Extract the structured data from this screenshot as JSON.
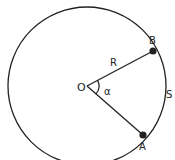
{
  "diagram": {
    "center": {
      "label": "O",
      "x": 87,
      "y": 86
    },
    "radius": 79,
    "points": [
      {
        "label": "B",
        "x": 153,
        "y": 51
      },
      {
        "label": "A",
        "x": 143,
        "y": 135
      }
    ],
    "labels": {
      "radius": "R",
      "angle": "α",
      "arc": "S"
    },
    "colors": {
      "stroke": "#222222",
      "background": "#ffffff"
    }
  }
}
